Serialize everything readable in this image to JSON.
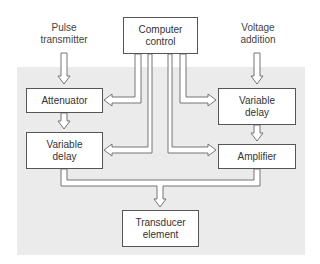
{
  "diagram": {
    "inputs": {
      "pulse_transmitter": [
        "Pulse",
        "transmitter"
      ],
      "voltage_addition": [
        "Voltage",
        "addition"
      ]
    },
    "blocks": {
      "computer_control": [
        "Computer",
        "control"
      ],
      "attenuator": [
        "Attenuator"
      ],
      "variable_delay_left": [
        "Variable",
        "delay"
      ],
      "variable_delay_right": [
        "Variable",
        "delay"
      ],
      "amplifier": [
        "Amplifier"
      ],
      "transducer_element": [
        "Transducer",
        "element"
      ]
    },
    "connections": [
      {
        "from": "Pulse transmitter",
        "to": "Attenuator"
      },
      {
        "from": "Attenuator",
        "to": "Variable delay (left)"
      },
      {
        "from": "Voltage addition",
        "to": "Variable delay (right)"
      },
      {
        "from": "Variable delay (right)",
        "to": "Amplifier"
      },
      {
        "from": "Computer control",
        "to": "Attenuator"
      },
      {
        "from": "Computer control",
        "to": "Variable delay (left)"
      },
      {
        "from": "Computer control",
        "to": "Variable delay (right)"
      },
      {
        "from": "Computer control",
        "to": "Amplifier"
      },
      {
        "from": "Variable delay (left)",
        "to": "Transducer element"
      },
      {
        "from": "Amplifier",
        "to": "Transducer element"
      }
    ],
    "colors": {
      "panel": "#ebebeb",
      "line": "#666666",
      "box_fill": "#ffffff"
    }
  }
}
